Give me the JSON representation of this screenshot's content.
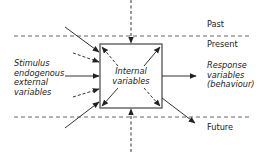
{
  "diagram": {
    "time_labels": {
      "past": "Past",
      "present": "Present",
      "future": "Future"
    },
    "left_label": [
      "Stimulus",
      "endogenous",
      "external",
      "variables"
    ],
    "center_label": [
      "Internal",
      "variables"
    ],
    "right_label": [
      "Response",
      "variables",
      "(behaviour)"
    ],
    "colors": {
      "line": "#333333",
      "dashed": "#555555",
      "text": "#222222"
    }
  }
}
